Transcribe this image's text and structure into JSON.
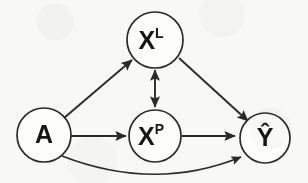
{
  "figure": {
    "type": "directed-graph",
    "width": 308,
    "height": 183,
    "background_color": "#f8f8f7",
    "stroke_color": "#2a2a2a",
    "node_fill_color": "#fdfdfc",
    "label_color": "#161616"
  },
  "nodes": [
    {
      "id": "A",
      "base": "A",
      "superscript": "",
      "hat": false,
      "cx": 44,
      "cy": 135,
      "r": 27
    },
    {
      "id": "XL",
      "base": "X",
      "superscript": "L",
      "hat": false,
      "cx": 155,
      "cy": 40,
      "r": 28
    },
    {
      "id": "XP",
      "base": "X",
      "superscript": "P",
      "hat": false,
      "cx": 155,
      "cy": 136,
      "r": 26
    },
    {
      "id": "Yhat",
      "base": "Ŷ",
      "superscript": "",
      "hat": true,
      "cx": 265,
      "cy": 138,
      "r": 25
    }
  ],
  "edges": [
    {
      "id": "a-to-xl",
      "from": "A",
      "to": "XL",
      "style": "straight",
      "direction": "forward"
    },
    {
      "id": "a-to-xp",
      "from": "A",
      "to": "XP",
      "style": "straight",
      "direction": "forward"
    },
    {
      "id": "a-to-yhat",
      "from": "A",
      "to": "Yhat",
      "style": "curved",
      "direction": "forward"
    },
    {
      "id": "xl-xp",
      "from": "XL",
      "to": "XP",
      "style": "straight",
      "direction": "bidirectional"
    },
    {
      "id": "xl-to-yhat",
      "from": "XL",
      "to": "Yhat",
      "style": "straight",
      "direction": "forward"
    },
    {
      "id": "xp-to-yhat",
      "from": "XP",
      "to": "Yhat",
      "style": "straight",
      "direction": "forward"
    }
  ]
}
